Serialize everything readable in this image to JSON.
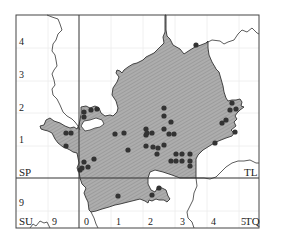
{
  "map": {
    "type": "distribution-dot-map",
    "grid_squares": {
      "top_left": "SP",
      "top_right": "TL",
      "bottom_left": "SU",
      "bottom_right": "TQ"
    },
    "left_axis_labels": [
      {
        "text": "4",
        "y": 45
      },
      {
        "text": "3",
        "y": 78
      },
      {
        "text": "2",
        "y": 111
      },
      {
        "text": "1",
        "y": 143
      },
      {
        "text": "9",
        "y": 206
      }
    ],
    "bottom_axis_labels": [
      {
        "text": "9",
        "x": 52
      },
      {
        "text": "0",
        "x": 84
      },
      {
        "text": "1",
        "x": 116
      },
      {
        "text": "2",
        "x": 148
      },
      {
        "text": "3",
        "x": 180
      },
      {
        "text": "4",
        "x": 211
      },
      {
        "text": "5",
        "x": 241
      }
    ],
    "colors": {
      "region_fill": "#a9a9a9",
      "hatch": "#8f8f8f",
      "outline": "#333333",
      "dot": "#333333",
      "frame": "#444444",
      "gridline": "#e6e6e6"
    },
    "records": [
      [
        84,
        112
      ],
      [
        91,
        110
      ],
      [
        97,
        109
      ],
      [
        84,
        117
      ],
      [
        196,
        45
      ],
      [
        115,
        134
      ],
      [
        124,
        133
      ],
      [
        146,
        129
      ],
      [
        146,
        135
      ],
      [
        169,
        134
      ],
      [
        174,
        134
      ],
      [
        146,
        146
      ],
      [
        164,
        145
      ],
      [
        215,
        143
      ],
      [
        232,
        103
      ],
      [
        230,
        110
      ],
      [
        236,
        109
      ],
      [
        226,
        120
      ],
      [
        222,
        123
      ],
      [
        235,
        132
      ],
      [
        164,
        108
      ],
      [
        164,
        116
      ],
      [
        171,
        122
      ],
      [
        164,
        129
      ],
      [
        147,
        133
      ],
      [
        152,
        133
      ],
      [
        153,
        147
      ],
      [
        158,
        148
      ],
      [
        128,
        150
      ],
      [
        157,
        154
      ],
      [
        176,
        154
      ],
      [
        182,
        154
      ],
      [
        190,
        154
      ],
      [
        176,
        161
      ],
      [
        182,
        161
      ],
      [
        190,
        161
      ],
      [
        190,
        166
      ],
      [
        171,
        161
      ],
      [
        66,
        133
      ],
      [
        71,
        133
      ],
      [
        66,
        146
      ],
      [
        82,
        168
      ],
      [
        80,
        170
      ],
      [
        118,
        196
      ],
      [
        84,
        162
      ],
      [
        88,
        167
      ],
      [
        94,
        159
      ],
      [
        159,
        188
      ],
      [
        152,
        195
      ]
    ]
  }
}
